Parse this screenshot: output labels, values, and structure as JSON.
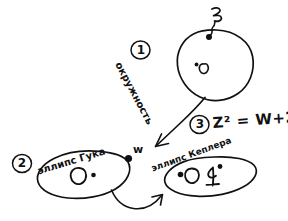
{
  "canvas": {
    "width": 288,
    "height": 221,
    "background": "#ffffff",
    "ink_color": "#111111",
    "title": "hand-drawn math diagram"
  },
  "diagram": {
    "kind": "hand-drawn sketch",
    "steps": [
      {
        "id": "step-1",
        "marker": "1"
      },
      {
        "id": "step-2",
        "marker": "2"
      },
      {
        "id": "step-3",
        "marker": "3"
      }
    ],
    "circle": {
      "label": "окружность",
      "center_label": "O",
      "point_label": "z"
    },
    "hooke_ellipse": {
      "label": "эллипс Гука",
      "center_label": "O",
      "point_label": "w"
    },
    "kepler_ellipse": {
      "label": "эллипс Кеплера",
      "focus_label": "O",
      "second_label": "4"
    },
    "formula": "Z² = W+2"
  }
}
